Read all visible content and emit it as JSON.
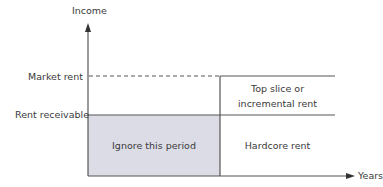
{
  "diagram": {
    "y_axis_label": "Income",
    "x_axis_label": "Years",
    "levels": {
      "market_rent": "Market rent",
      "rent_receivable": "Rent receivable"
    },
    "regions": {
      "ignore": "Ignore this period",
      "top_slice_line1": "Top slice or",
      "top_slice_line2": "incremental rent",
      "hardcore": "Hardcore rent"
    },
    "colors": {
      "axis": "#555555",
      "shaded_region": "#dcdce6",
      "text": "#3a3a3a"
    }
  }
}
